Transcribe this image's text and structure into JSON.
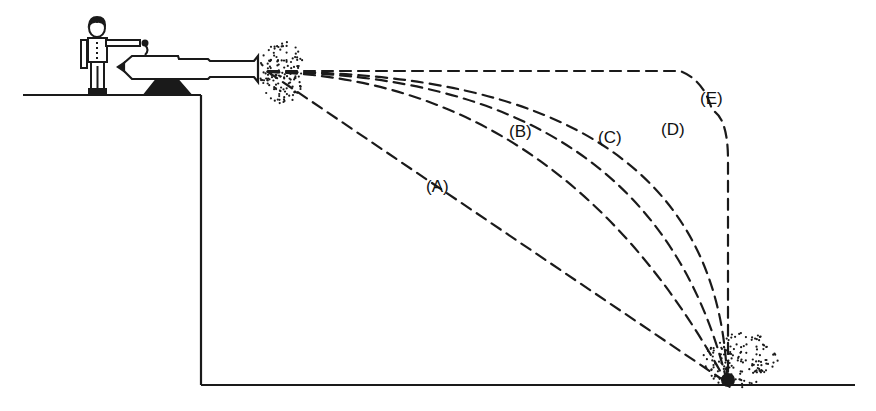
{
  "diagram": {
    "colors": {
      "ink": "#1a1a1a",
      "background": "#ffffff"
    },
    "scene": {
      "figure": "person-operating-cannon",
      "cannon": "cannon",
      "muzzle_blast": "muzzle-smoke",
      "impact": "impact-explosion"
    },
    "trajectories": [
      {
        "id": "A",
        "label": "(A)",
        "shape": "straight-line"
      },
      {
        "id": "B",
        "label": "(B)",
        "shape": "shallow-curve"
      },
      {
        "id": "C",
        "label": "(C)",
        "shape": "curve"
      },
      {
        "id": "D",
        "label": "(D)",
        "shape": "steep-curve"
      },
      {
        "id": "E",
        "label": "(E)",
        "shape": "horizontal-then-vertical"
      }
    ]
  }
}
